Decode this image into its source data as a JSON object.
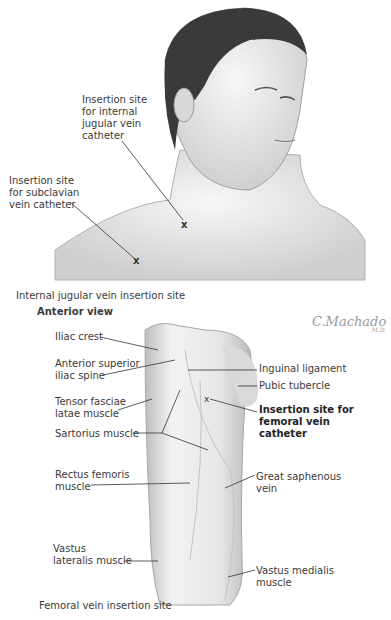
{
  "figure": {
    "top_panel": {
      "labels": {
        "internal_jugular": "Insertion site\nfor internal\njugular vein\ncatheter",
        "subclavian": "Insertion site\nfor subclavian\nvein catheter"
      },
      "markers": [
        "x",
        "x"
      ],
      "caption": "Internal jugular vein insertion site"
    },
    "bottom_panel": {
      "view_title": "Anterior view",
      "signature": "C.Machado",
      "signature_sub": "M.D.",
      "left_labels": {
        "iliac_crest": "Iliac crest",
        "asis": "Anterior superior\niliac spine",
        "tfl": "Tensor fasciae\nlatae muscle",
        "sartorius": "Sartorius muscle",
        "rectus": "Rectus femoris\nmuscle",
        "vastus_lat": "Vastus\nlateralis muscle"
      },
      "right_labels": {
        "inguinal": "Inguinal ligament",
        "pubic": "Pubic tubercle",
        "femoral_site": "Insertion site for\nfemoral vein\ncatheter",
        "saphenous": "Great saphenous\nvein",
        "vastus_med": "Vastus medialis\nmuscle"
      },
      "marker": "x",
      "caption": "Femoral vein insertion site"
    }
  }
}
